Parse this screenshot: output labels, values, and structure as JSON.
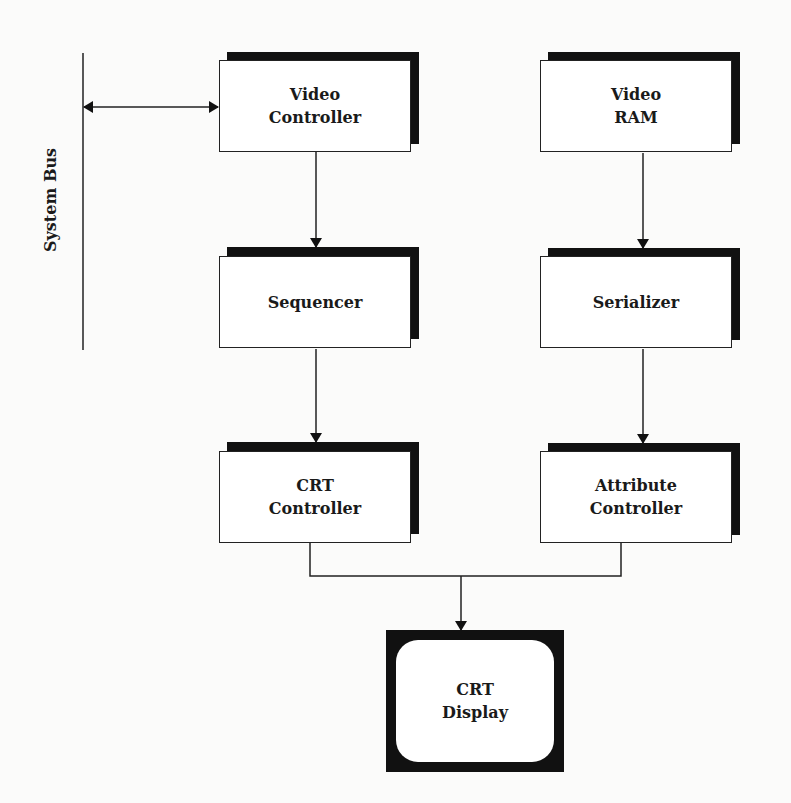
{
  "diagram": {
    "bus": {
      "label": "System Bus"
    },
    "nodes": {
      "video_controller": {
        "label": "Video\nController"
      },
      "video_ram": {
        "label": "Video\nRAM"
      },
      "sequencer": {
        "label": "Sequencer"
      },
      "serializer": {
        "label": "Serializer"
      },
      "crt_controller": {
        "label": "CRT\nController"
      },
      "attribute_controller": {
        "label": "Attribute\nController"
      },
      "crt_display": {
        "label": "CRT\nDisplay"
      }
    },
    "edges": [
      {
        "from": "system_bus",
        "to": "video_controller",
        "type": "bidirectional"
      },
      {
        "from": "video_controller",
        "to": "sequencer"
      },
      {
        "from": "sequencer",
        "to": "crt_controller"
      },
      {
        "from": "video_ram",
        "to": "serializer"
      },
      {
        "from": "serializer",
        "to": "attribute_controller"
      },
      {
        "from": "crt_controller",
        "to": "crt_display"
      },
      {
        "from": "attribute_controller",
        "to": "crt_display"
      }
    ]
  }
}
